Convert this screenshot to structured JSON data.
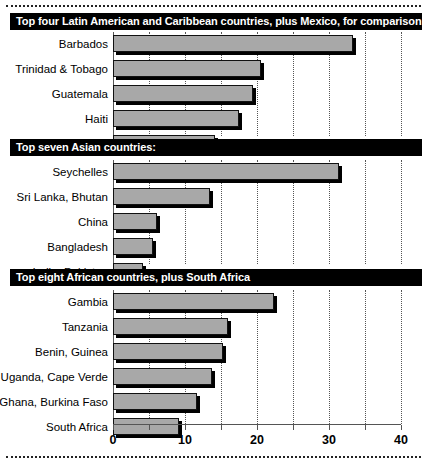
{
  "chart_data": {
    "type": "bar",
    "orientation": "horizontal",
    "title": "",
    "xlabel": "",
    "ylabel": "",
    "xlim": [
      0,
      40
    ],
    "xticks": [
      0,
      5,
      10,
      15,
      20,
      25,
      30,
      35,
      40
    ],
    "xticklabels": [
      "0",
      "",
      "10",
      "",
      "20",
      "",
      "30",
      "",
      "40"
    ],
    "grid": true,
    "grid_axis": "x",
    "legend": "none",
    "bar_color": "#a8a8a8",
    "bar_edge_color": "#111111",
    "groups": [
      {
        "banner": "Top four Latin American and Caribbean countries, plus Mexico, for comparison:",
        "categories": [
          "Barbados",
          "Trinidad & Tobago",
          "Guatemala",
          "Haiti",
          "Mexico"
        ],
        "values": [
          33.4,
          20.5,
          19.5,
          17.5,
          14.2
        ]
      },
      {
        "banner": "Top seven Asian countries:",
        "categories": [
          "Seychelles",
          "Sri Lanka, Bhutan",
          "China",
          "Bangladesh",
          "India, Pakistan"
        ],
        "values": [
          31.4,
          13.5,
          6.1,
          5.6,
          4.2
        ]
      },
      {
        "banner": "Top eight African countries, plus South Africa",
        "categories": [
          "Gambia",
          "Tanzania",
          "Benin, Guinea",
          "Uganda, Cape Verde",
          "Ghana, Burkina Faso",
          "South Africa"
        ],
        "values": [
          22.3,
          16.0,
          15.3,
          13.8,
          11.7,
          9.1
        ]
      }
    ]
  }
}
